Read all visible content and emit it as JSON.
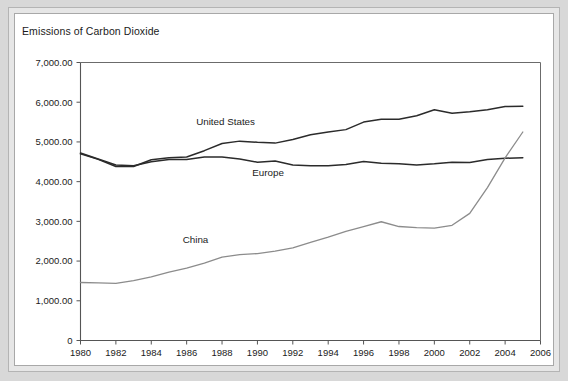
{
  "chart_data": {
    "type": "line",
    "title": "Emissions of Carbon Dioxide",
    "xlabel": "",
    "ylabel": "",
    "xlim": [
      1980,
      2006
    ],
    "ylim": [
      0,
      7000
    ],
    "grid": false,
    "legend_position": "inline-labels",
    "x_tick_labels": [
      "1980",
      "1982",
      "1984",
      "1986",
      "1988",
      "1990",
      "1992",
      "1994",
      "1996",
      "1998",
      "2000",
      "2002",
      "2004",
      "2006"
    ],
    "y_tick_labels": [
      "0",
      "1,000.00",
      "2,000.00",
      "3,000.00",
      "4,000.00",
      "5,000.00",
      "6,000.00",
      "7,000.00"
    ],
    "y_tick_values": [
      0,
      1000,
      2000,
      3000,
      4000,
      5000,
      6000,
      7000
    ],
    "x": [
      1980,
      1981,
      1982,
      1983,
      1984,
      1985,
      1986,
      1987,
      1988,
      1989,
      1990,
      1991,
      1992,
      1993,
      1994,
      1995,
      1996,
      1997,
      1998,
      1999,
      2000,
      2001,
      2002,
      2003,
      2004,
      2005
    ],
    "series": [
      {
        "name": "United States",
        "color": "#2b2b2b",
        "width": 1.5,
        "label_x": 1988.2,
        "label_y": 5420,
        "values": [
          4700,
          4560,
          4380,
          4380,
          4550,
          4600,
          4620,
          4780,
          4960,
          5020,
          4990,
          4970,
          5060,
          5180,
          5250,
          5310,
          5500,
          5570,
          5570,
          5660,
          5810,
          5720,
          5760,
          5810,
          5890,
          5900
        ]
      },
      {
        "name": "Europe",
        "color": "#2b2b2b",
        "width": 1.5,
        "label_x": 1990.6,
        "label_y": 4140,
        "values": [
          4720,
          4570,
          4420,
          4400,
          4500,
          4560,
          4560,
          4620,
          4620,
          4570,
          4490,
          4520,
          4420,
          4400,
          4400,
          4430,
          4510,
          4460,
          4450,
          4420,
          4450,
          4490,
          4480,
          4560,
          4590,
          4600
        ]
      },
      {
        "name": "China",
        "color": "#8c8c8c",
        "width": 1.3,
        "label_x": 1986.5,
        "label_y": 2450,
        "values": [
          1460,
          1450,
          1440,
          1510,
          1600,
          1720,
          1820,
          1950,
          2100,
          2160,
          2190,
          2250,
          2330,
          2470,
          2600,
          2750,
          2870,
          2990,
          2870,
          2840,
          2830,
          2900,
          3200,
          3850,
          4600,
          5250
        ]
      }
    ]
  }
}
